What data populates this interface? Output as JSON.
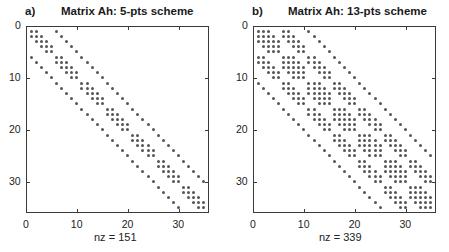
{
  "chart_data": [
    {
      "type": "spy",
      "panel_label": "a)",
      "title": "Matrix Ah: 5-pts scheme",
      "xlabel": "nz = 151",
      "ylabel": "",
      "xlim": [
        0,
        36
      ],
      "ylim": [
        0,
        36
      ],
      "y_reversed": true,
      "xticks": [
        0,
        10,
        20,
        30
      ],
      "yticks": [
        0,
        10,
        20,
        30
      ],
      "matrix_size": 35,
      "grid": {
        "nx": 5,
        "ny": 7
      },
      "stencil_offsets": [
        [
          0,
          -1
        ],
        [
          -1,
          0
        ],
        [
          0,
          0
        ],
        [
          1,
          0
        ],
        [
          0,
          1
        ]
      ],
      "nnz": 151,
      "marker_color": "#555555"
    },
    {
      "type": "spy",
      "panel_label": "b)",
      "title": "Matrix Ah: 13-pts scheme",
      "xlabel": "nz = 339",
      "ylabel": "",
      "xlim": [
        0,
        36
      ],
      "ylim": [
        0,
        36
      ],
      "y_reversed": true,
      "xticks": [
        0,
        10,
        20,
        30
      ],
      "yticks": [
        0,
        10,
        20,
        30
      ],
      "matrix_size": 35,
      "grid": {
        "nx": 5,
        "ny": 7
      },
      "stencil_offsets": [
        [
          0,
          -2
        ],
        [
          -1,
          -1
        ],
        [
          0,
          -1
        ],
        [
          1,
          -1
        ],
        [
          -2,
          0
        ],
        [
          -1,
          0
        ],
        [
          0,
          0
        ],
        [
          1,
          0
        ],
        [
          2,
          0
        ],
        [
          -1,
          1
        ],
        [
          0,
          1
        ],
        [
          1,
          1
        ],
        [
          0,
          2
        ]
      ],
      "nnz": 339,
      "marker_color": "#555555"
    }
  ]
}
